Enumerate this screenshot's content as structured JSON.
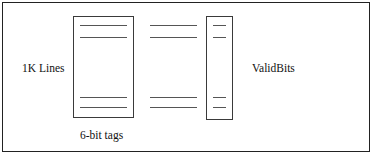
{
  "figure": {
    "labels": {
      "left_label": "1K Lines",
      "right_label": "ValidBits",
      "bottom_label": "6-bit tags"
    },
    "colors": {
      "frame_border": "#222222",
      "box_border": "#3a3a3a",
      "rule": "#555555",
      "background": "#ffffff",
      "text": "#111111"
    },
    "structures": {
      "tag_array_box": {
        "name": "6-bit tags array",
        "row_marks": 4
      },
      "middle_rows": {
        "name": "unboxed row marks",
        "row_marks": 4
      },
      "valid_bits_box": {
        "name": "ValidBits column",
        "row_marks": 4
      }
    }
  }
}
